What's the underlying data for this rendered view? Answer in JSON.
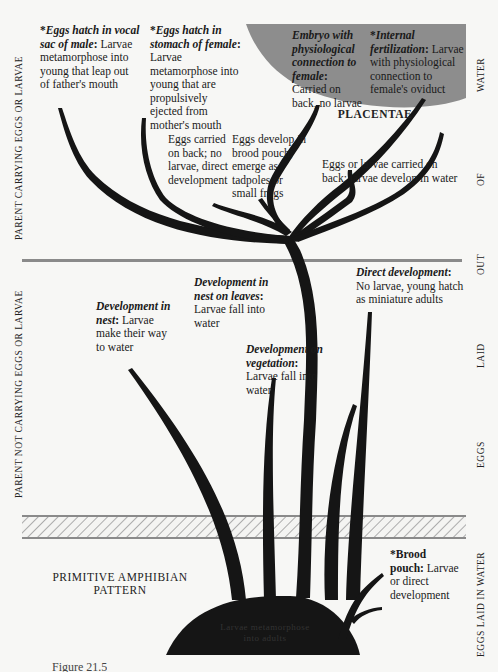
{
  "diagram": {
    "colors": {
      "background": "#f7f7f5",
      "branch": "#151515",
      "placentae_region": "#8d8d8d",
      "divider": "#8a8a8a",
      "hatch": "#9a9a9a"
    },
    "left_axis": {
      "upper": "PARENT CARRYING EGGS OR LARVAE",
      "lower": "PARENT NOT CARRYING EGGS OR LARVAE"
    },
    "right_axis": {
      "water": "WATER",
      "of": "OF",
      "out": "OUT",
      "laid": "LAID",
      "eggs": "EGGS",
      "bottom": "EGGS LAID IN WATER"
    },
    "region_label": "PLACENTAE",
    "base_label": {
      "line1": "PRIMITIVE AMPHIBIAN",
      "line2": "PATTERN"
    },
    "base_mound_text": {
      "line1": "Larvae metamorphose",
      "line2": "into adults"
    },
    "nodes": [
      {
        "id": "vocal-sac",
        "star": "*",
        "title": "Eggs hatch in vocal sac of male",
        "body": "Larvae metamorphose into young that leap out of father's mouth"
      },
      {
        "id": "stomach",
        "star": "*",
        "title": "Eggs hatch in stomach of female",
        "body": "Larvae metamorphose into young that are propulsively ejected from mother's mouth"
      },
      {
        "id": "embryo-connection",
        "star": "",
        "title": "Embryo with physiological connection to female",
        "body": "Carried on back, no larvae"
      },
      {
        "id": "internal-fertilization",
        "star": "*",
        "title": "Internal fertilization",
        "body": "Larvae with physiological connection to female's oviduct"
      },
      {
        "id": "eggs-on-back",
        "star": "",
        "title": "",
        "body": "Eggs carried on back; no larvae, direct development"
      },
      {
        "id": "brood-pouch-upper",
        "star": "",
        "title": "",
        "body": "Eggs develop in brood pouch; emerge as tadpoles or small frogs"
      },
      {
        "id": "eggs-or-larvae-back",
        "star": "",
        "title": "",
        "body": "Eggs or larvae carried on back; larvae develop in water"
      },
      {
        "id": "nest",
        "star": "",
        "title": "Development in nest",
        "body": "Larvae make their way to water"
      },
      {
        "id": "nest-on-leaves",
        "star": "",
        "title": "Development in nest on leaves",
        "body": "Larvae fall into water"
      },
      {
        "id": "vegetation",
        "star": "",
        "title": "Development on vegetation",
        "body": "Larvae fall into water"
      },
      {
        "id": "direct-development",
        "star": "",
        "title": "Direct development",
        "body": "No larvae, young hatch as miniature adults"
      },
      {
        "id": "brood-pouch-lower",
        "star": "*",
        "title": "Brood pouch",
        "body": "Larvae or direct development"
      }
    ],
    "caption_partial": "Figure 21.5"
  }
}
